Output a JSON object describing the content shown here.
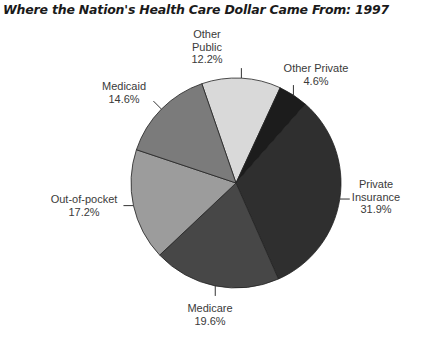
{
  "chart_data": {
    "type": "pie",
    "title": "Where the Nation's Health Care Dollar Came From: 1997",
    "unit": "%",
    "start_angle_deg": -19,
    "direction": "clockwise",
    "slices": [
      {
        "name": "Other Public",
        "label_lines": [
          "Other",
          "Public"
        ],
        "value": 12.2,
        "display": "12.2%",
        "color": "#d9d9d9"
      },
      {
        "name": "Other Private",
        "label_lines": [
          "Other Private"
        ],
        "value": 4.6,
        "display": "4.6%",
        "color": "#1c1c1c"
      },
      {
        "name": "Private Insurance",
        "label_lines": [
          "Private",
          "Insurance"
        ],
        "value": 31.9,
        "display": "31.9%",
        "color": "#2f2f2f"
      },
      {
        "name": "Medicare",
        "label_lines": [
          "Medicare"
        ],
        "value": 19.6,
        "display": "19.6%",
        "color": "#474747"
      },
      {
        "name": "Out-of-pocket",
        "label_lines": [
          "Out-of-pocket"
        ],
        "value": 17.2,
        "display": "17.2%",
        "color": "#9c9c9c"
      },
      {
        "name": "Medicaid",
        "label_lines": [
          "Medicaid"
        ],
        "value": 14.6,
        "display": "14.6%",
        "color": "#7b7b7b"
      }
    ],
    "legend": "none (callout labels)"
  },
  "labels": {
    "other_public": {
      "line1": "Other",
      "line2": "Public",
      "pct": "12.2%"
    },
    "other_private": {
      "line1": "Other Private",
      "pct": "4.6%"
    },
    "private_insurance": {
      "line1": "Private",
      "line2": "Insurance",
      "pct": "31.9%"
    },
    "medicare": {
      "line1": "Medicare",
      "pct": "19.6%"
    },
    "out_of_pocket": {
      "line1": "Out-of-pocket",
      "pct": "17.2%"
    },
    "medicaid": {
      "line1": "Medicaid",
      "pct": "14.6%"
    }
  }
}
